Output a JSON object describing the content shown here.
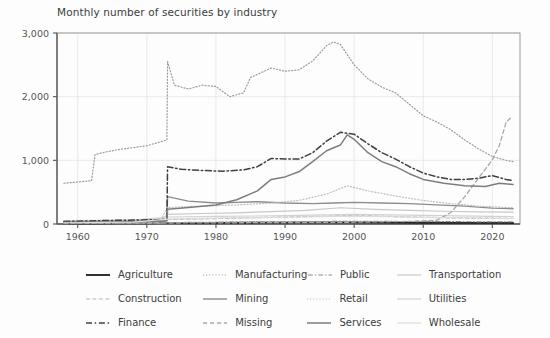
{
  "chart_data": {
    "type": "line",
    "title": "Monthly number of securities by industry",
    "xlabel": "",
    "ylabel": "",
    "xlim": [
      1957,
      2024
    ],
    "ylim": [
      0,
      3000
    ],
    "xticks": [
      1960,
      1970,
      1980,
      1990,
      2000,
      2010,
      2020
    ],
    "xticklabels": [
      "1960",
      "1970",
      "1980",
      "1990",
      "2000",
      "2010",
      "2020"
    ],
    "yticks": [
      0,
      1000,
      2000,
      3000
    ],
    "yticklabels": [
      "0",
      "1,000",
      "2,000",
      "3,000"
    ],
    "grid": true,
    "legend_position": "below",
    "legend_columns": 4,
    "legend_rows": 3,
    "background_color": "#fdfdfd",
    "axis_color": "#555555",
    "grid_color": "#e4e4e4",
    "series": [
      {
        "name": "Agriculture",
        "style": "solid",
        "color": "#1a1a1a",
        "width": 1.8,
        "x": [
          1958,
          1962,
          1966,
          1970,
          1973,
          1976,
          1980,
          1985,
          1990,
          1995,
          2000,
          2005,
          2010,
          2015,
          2020,
          2023
        ],
        "values": [
          6,
          8,
          9,
          10,
          14,
          15,
          18,
          20,
          22,
          24,
          25,
          22,
          20,
          18,
          17,
          16
        ]
      },
      {
        "name": "Manufacturing",
        "style": "dotted",
        "color": "#9a9a9a",
        "width": 1.2,
        "x": [
          1958,
          1960,
          1962,
          1962.5,
          1964,
          1966,
          1968,
          1970,
          1972,
          1972.9,
          1973,
          1974,
          1976,
          1978,
          1980,
          1982,
          1984,
          1985,
          1986,
          1988,
          1990,
          1992,
          1994,
          1996,
          1997,
          1998,
          2000,
          2002,
          2004,
          2006,
          2008,
          2010,
          2012,
          2014,
          2016,
          2018,
          2020,
          2022,
          2023
        ],
        "values": [
          640,
          660,
          680,
          1090,
          1130,
          1170,
          1200,
          1230,
          1290,
          1320,
          2550,
          2180,
          2120,
          2180,
          2160,
          2000,
          2060,
          2300,
          2350,
          2450,
          2400,
          2420,
          2560,
          2800,
          2860,
          2820,
          2500,
          2280,
          2150,
          2060,
          1880,
          1700,
          1600,
          1480,
          1320,
          1180,
          1060,
          1000,
          980
        ]
      },
      {
        "name": "Public",
        "style": "dashdot",
        "color": "#8a8a8a",
        "width": 1.2,
        "x": [
          1958,
          1965,
          1972,
          1973,
          1980,
          1990,
          2000,
          2010,
          2020,
          2023
        ],
        "values": [
          3,
          5,
          7,
          22,
          28,
          35,
          42,
          38,
          34,
          32
        ]
      },
      {
        "name": "Transportation",
        "style": "solid",
        "color": "#c8c8c8",
        "width": 1.2,
        "x": [
          1958,
          1965,
          1972,
          1973,
          1978,
          1983,
          1988,
          1993,
          1998,
          2003,
          2008,
          2013,
          2018,
          2023
        ],
        "values": [
          48,
          58,
          66,
          150,
          165,
          175,
          195,
          215,
          255,
          230,
          215,
          200,
          190,
          185
        ]
      },
      {
        "name": "Construction",
        "style": "dashed",
        "color": "#b4b4b4",
        "width": 1.2,
        "x": [
          1958,
          1965,
          1972,
          1973,
          1980,
          1988,
          1995,
          2000,
          2008,
          2015,
          2023
        ],
        "values": [
          14,
          20,
          26,
          70,
          85,
          105,
          120,
          135,
          110,
          95,
          88
        ]
      },
      {
        "name": "Mining",
        "style": "solid",
        "color": "#8c8c8c",
        "width": 1.4,
        "x": [
          1958,
          1964,
          1970,
          1972.9,
          1973,
          1976,
          1980,
          1983,
          1986,
          1990,
          1994,
          1997,
          2000,
          2004,
          2008,
          2012,
          2016,
          2020,
          2023
        ],
        "values": [
          30,
          42,
          55,
          62,
          430,
          360,
          330,
          340,
          350,
          330,
          320,
          330,
          340,
          330,
          320,
          300,
          280,
          250,
          240
        ]
      },
      {
        "name": "Retail",
        "style": "dotted",
        "color": "#bdbdbd",
        "width": 1.2,
        "x": [
          1958,
          1965,
          1972,
          1973,
          1978,
          1983,
          1988,
          1992,
          1996,
          1999,
          2002,
          2006,
          2010,
          2014,
          2018,
          2023
        ],
        "values": [
          40,
          55,
          68,
          260,
          280,
          300,
          330,
          370,
          470,
          600,
          520,
          440,
          370,
          320,
          280,
          255
        ]
      },
      {
        "name": "Utilities",
        "style": "solid",
        "color": "#d2d2d2",
        "width": 1.2,
        "x": [
          1958,
          1968,
          1973,
          1980,
          1990,
          2000,
          2010,
          2020,
          2023
        ],
        "values": [
          55,
          62,
          110,
          120,
          130,
          150,
          135,
          120,
          115
        ]
      },
      {
        "name": "Finance",
        "style": "dashdot",
        "color": "#3f3f3f",
        "width": 1.5,
        "x": [
          1958,
          1963,
          1968,
          1972,
          1972.9,
          1973,
          1975,
          1978,
          1981,
          1984,
          1986,
          1988,
          1990,
          1992,
          1994,
          1996,
          1998,
          2000,
          2002,
          2004,
          2006,
          2008,
          2010,
          2012,
          2014,
          2016,
          2018,
          2020,
          2022,
          2023
        ],
        "values": [
          40,
          52,
          62,
          70,
          78,
          900,
          860,
          840,
          830,
          850,
          900,
          1030,
          1020,
          1020,
          1120,
          1300,
          1440,
          1410,
          1260,
          1120,
          1020,
          900,
          800,
          740,
          700,
          700,
          720,
          760,
          700,
          680
        ]
      },
      {
        "name": "Missing",
        "style": "dashed",
        "color": "#a8a8a8",
        "width": 1.3,
        "x": [
          1958,
          1970,
          1980,
          1990,
          2000,
          2008,
          2012,
          2014,
          2016,
          2018,
          2020,
          2021,
          2022,
          2022.6
        ],
        "values": [
          10,
          14,
          18,
          22,
          28,
          40,
          60,
          180,
          430,
          720,
          1010,
          1230,
          1600,
          1660
        ]
      },
      {
        "name": "Services",
        "style": "solid",
        "color": "#7d7d7d",
        "width": 1.5,
        "x": [
          1958,
          1966,
          1972,
          1972.9,
          1973,
          1976,
          1980,
          1983,
          1986,
          1988,
          1990,
          1992,
          1994,
          1996,
          1998,
          1999,
          2000,
          2002,
          2004,
          2006,
          2008,
          2010,
          2013,
          2016,
          2019,
          2021,
          2023
        ],
        "values": [
          22,
          32,
          42,
          48,
          230,
          260,
          300,
          380,
          520,
          700,
          740,
          820,
          980,
          1150,
          1240,
          1400,
          1330,
          1120,
          980,
          900,
          790,
          700,
          640,
          600,
          590,
          640,
          620
        ]
      },
      {
        "name": "Wholesale",
        "style": "solid",
        "color": "#dcdcdc",
        "width": 1.2,
        "x": [
          1958,
          1968,
          1973,
          1982,
          1992,
          2000,
          2010,
          2020,
          2023
        ],
        "values": [
          20,
          28,
          75,
          95,
          110,
          125,
          105,
          90,
          85
        ]
      }
    ]
  },
  "legend": {
    "rows": [
      [
        {
          "label": "Agriculture",
          "series": "Agriculture"
        },
        {
          "label": "Manufacturing",
          "series": "Manufacturing"
        },
        {
          "label": "Public",
          "series": "Public"
        },
        {
          "label": "Transportation",
          "series": "Transportation"
        }
      ],
      [
        {
          "label": "Construction",
          "series": "Construction"
        },
        {
          "label": "Mining",
          "series": "Mining"
        },
        {
          "label": "Retail",
          "series": "Retail"
        },
        {
          "label": "Utilities",
          "series": "Utilities"
        }
      ],
      [
        {
          "label": "Finance",
          "series": "Finance"
        },
        {
          "label": "Missing",
          "series": "Missing"
        },
        {
          "label": "Services",
          "series": "Services"
        },
        {
          "label": "Wholesale",
          "series": "Wholesale"
        }
      ]
    ]
  }
}
